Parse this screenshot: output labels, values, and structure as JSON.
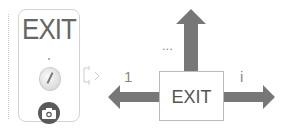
{
  "panel": {
    "exit_text": "EXIT",
    "knob_icon": "rotary-knob-icon",
    "camera_icon": "camera-icon"
  },
  "diagram": {
    "exit_text": "EXIT",
    "label_left": "1",
    "label_up": "...",
    "label_right": "i",
    "arrow_color": "#777777"
  }
}
